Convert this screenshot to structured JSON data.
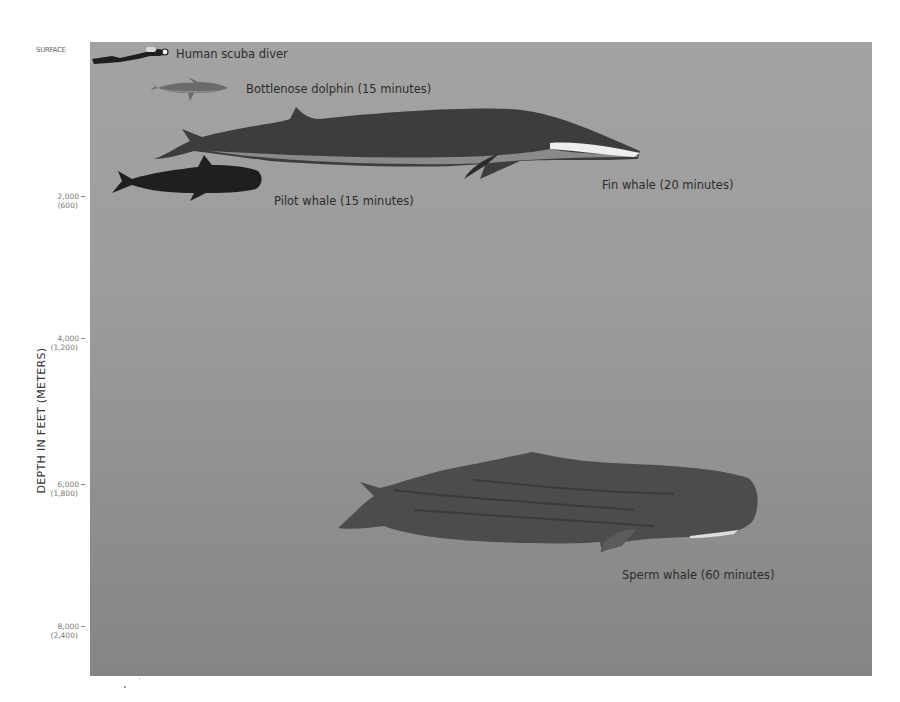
{
  "axis": {
    "title": "DEPTH IN FEET (METERS)",
    "surface_label": "SURFACE",
    "ticks": [
      {
        "feet": "2,000",
        "meters": "(600)"
      },
      {
        "feet": "4,000",
        "meters": "(1,200)"
      },
      {
        "feet": "6,000",
        "meters": "(1,800)"
      },
      {
        "feet": "8,000",
        "meters": "(2,400)"
      }
    ]
  },
  "animals": [
    {
      "id": "diver",
      "label": "Human scuba diver"
    },
    {
      "id": "dolphin",
      "label": "Bottlenose dolphin (15 minutes)"
    },
    {
      "id": "fin-whale",
      "label": "Fin whale (20 minutes)"
    },
    {
      "id": "pilot-whale",
      "label": "Pilot whale (15 minutes)"
    },
    {
      "id": "sperm-whale",
      "label": "Sperm whale (60 minutes)"
    }
  ],
  "colors": {
    "water_top": "#a3a3a3",
    "water_bottom": "#858585",
    "fin_whale": "#3e3e3e",
    "pilot_whale": "#222222",
    "sperm_whale": "#4d4d4d",
    "dolphin": "#6a6a6a"
  }
}
